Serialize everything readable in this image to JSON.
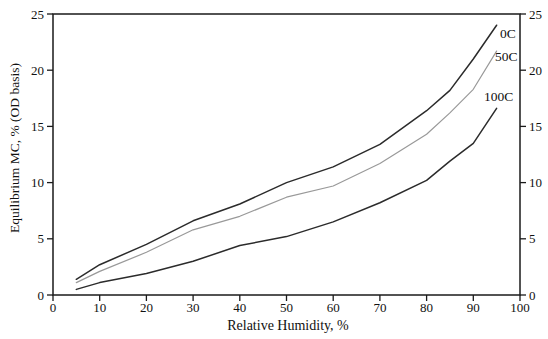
{
  "figure": {
    "x_axis_label": "Relative Humidity, %",
    "y_axis_label": "Equilibrium MC, % (OD basis)"
  },
  "chart_data": {
    "type": "line",
    "title": "",
    "xlabel": "Relative Humidity, %",
    "ylabel": "Equilibrium MC, % (OD basis)",
    "xlim": [
      0,
      100
    ],
    "ylim": [
      0,
      25
    ],
    "x_ticks": [
      0,
      10,
      20,
      30,
      40,
      50,
      60,
      70,
      80,
      90,
      100
    ],
    "y_ticks": [
      0,
      5,
      10,
      15,
      20,
      25
    ],
    "y_ticks_right_side": true,
    "grid": false,
    "legend": "inline-curve-labels",
    "x": [
      5,
      10,
      20,
      30,
      40,
      50,
      60,
      70,
      80,
      85,
      90,
      95
    ],
    "series": [
      {
        "name": "0C",
        "color": "#2b2b2b",
        "values": [
          1.4,
          2.7,
          4.5,
          6.6,
          8.1,
          10.0,
          11.4,
          13.4,
          16.4,
          18.2,
          21.0,
          24.0
        ]
      },
      {
        "name": "50C",
        "color": "#999999",
        "values": [
          1.1,
          2.1,
          3.8,
          5.8,
          7.0,
          8.7,
          9.7,
          11.7,
          14.3,
          16.2,
          18.3,
          21.7
        ]
      },
      {
        "name": "100C",
        "color": "#2b2b2b",
        "values": [
          0.5,
          1.1,
          1.9,
          3.0,
          4.4,
          5.2,
          6.5,
          8.2,
          10.2,
          11.9,
          13.5,
          16.6
        ]
      }
    ],
    "axis_color": "#1a1a1a"
  }
}
